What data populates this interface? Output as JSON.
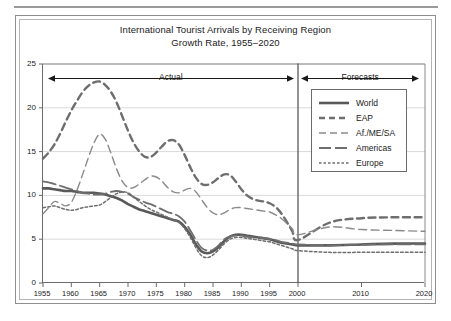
{
  "figure": {
    "title_line1": "International Tourist Arrivals by Receiving Region",
    "title_line2": "Growth Rate, 1955–2020",
    "annotation_actual": "Actual",
    "annotation_forecasts": "Forecasts",
    "divider_year": 2000
  },
  "chart_data": {
    "type": "line",
    "title": "International Tourist Arrivals by Receiving Region Growth Rate, 1955–2020",
    "subtitle": "Growth Rate, 1955–2020",
    "xlabel": "",
    "ylabel": "",
    "xlim": [
      1955,
      2020
    ],
    "ylim": [
      0,
      25
    ],
    "yticks": [
      0,
      5,
      10,
      15,
      20,
      25
    ],
    "xticks": [
      1955,
      1960,
      1965,
      1970,
      1975,
      1980,
      1985,
      1990,
      1995,
      2000,
      2010,
      2020
    ],
    "grid": "horizontal",
    "legend_position": "upper-right-inside",
    "annotations": [
      {
        "label": "Actual",
        "x_from": 1955,
        "x_to": 2000,
        "y": 23.6,
        "style": "double-arrow"
      },
      {
        "label": "Forecasts",
        "x_from": 2000,
        "x_to": 2020,
        "y": 23.6,
        "style": "double-arrow"
      }
    ],
    "vertical_divider_x": 2000,
    "x": [
      1955,
      1956,
      1957,
      1958,
      1959,
      1960,
      1961,
      1962,
      1963,
      1964,
      1965,
      1966,
      1967,
      1968,
      1969,
      1970,
      1971,
      1972,
      1973,
      1974,
      1975,
      1976,
      1977,
      1978,
      1979,
      1980,
      1981,
      1982,
      1983,
      1984,
      1985,
      1986,
      1987,
      1988,
      1989,
      1990,
      1991,
      1992,
      1993,
      1994,
      1995,
      1996,
      1997,
      1998,
      1999,
      2000,
      2005,
      2010,
      2015,
      2020
    ],
    "series": [
      {
        "name": "World",
        "style": "solid",
        "color": "#595959",
        "width": 2.6,
        "values": [
          10.8,
          10.8,
          10.7,
          10.6,
          10.5,
          10.5,
          10.4,
          10.3,
          10.3,
          10.3,
          10.2,
          10.1,
          9.9,
          9.7,
          9.4,
          9.0,
          8.7,
          8.4,
          8.2,
          8.0,
          7.8,
          7.6,
          7.4,
          7.2,
          7.0,
          6.4,
          5.5,
          4.4,
          3.6,
          3.4,
          3.6,
          4.1,
          4.8,
          5.3,
          5.5,
          5.5,
          5.4,
          5.3,
          5.2,
          5.1,
          5.0,
          4.8,
          4.6,
          4.5,
          4.4,
          4.3,
          4.3,
          4.4,
          4.5,
          4.5
        ]
      },
      {
        "name": "EAP",
        "style": "dashed",
        "color": "#6e6e6e",
        "width": 2.4,
        "values": [
          14.2,
          14.9,
          15.8,
          17.0,
          18.4,
          19.7,
          20.8,
          21.8,
          22.5,
          22.9,
          23.0,
          22.6,
          21.8,
          20.6,
          19.0,
          17.4,
          16.0,
          15.0,
          14.4,
          14.4,
          14.9,
          15.6,
          16.2,
          16.3,
          15.8,
          14.6,
          13.2,
          12.0,
          11.3,
          11.2,
          11.5,
          12.0,
          12.4,
          12.3,
          11.6,
          10.7,
          10.0,
          9.6,
          9.4,
          9.3,
          9.1,
          8.7,
          8.0,
          7.0,
          5.9,
          4.9,
          6.9,
          7.4,
          7.5,
          7.5
        ]
      },
      {
        "name": "Af./ME/SA",
        "style": "longdash-thin",
        "color": "#8a8a8a",
        "width": 1.4,
        "values": [
          7.9,
          8.6,
          9.3,
          9.1,
          8.8,
          9.2,
          10.6,
          12.4,
          14.3,
          16.0,
          17.0,
          16.4,
          14.8,
          13.0,
          11.6,
          10.9,
          10.9,
          11.3,
          11.8,
          12.2,
          12.1,
          11.6,
          10.9,
          10.4,
          10.3,
          10.6,
          10.8,
          10.4,
          9.5,
          8.6,
          8.0,
          7.8,
          8.0,
          8.4,
          8.6,
          8.6,
          8.5,
          8.4,
          8.3,
          8.2,
          8.1,
          7.8,
          7.4,
          6.8,
          6.2,
          5.5,
          6.4,
          6.1,
          6.0,
          5.9
        ]
      },
      {
        "name": "Americas",
        "style": "longdash",
        "color": "#6e6e6e",
        "width": 1.8,
        "values": [
          11.6,
          11.5,
          11.3,
          11.1,
          10.9,
          10.7,
          10.5,
          10.3,
          10.2,
          10.1,
          10.1,
          10.2,
          10.4,
          10.5,
          10.4,
          10.2,
          9.8,
          9.5,
          9.2,
          9.0,
          8.7,
          8.4,
          8.1,
          7.9,
          7.6,
          7.0,
          6.0,
          4.9,
          4.0,
          3.7,
          3.8,
          4.3,
          5.0,
          5.3,
          5.4,
          5.4,
          5.3,
          5.2,
          5.2,
          5.1,
          5.0,
          4.9,
          4.7,
          4.6,
          4.5,
          4.4,
          4.3,
          4.4,
          4.4,
          4.4
        ]
      },
      {
        "name": "Europe",
        "style": "dotted",
        "color": "#6e6e6e",
        "width": 1.5,
        "values": [
          8.6,
          8.7,
          8.8,
          8.6,
          8.4,
          8.3,
          8.4,
          8.6,
          8.7,
          8.8,
          8.9,
          9.3,
          9.8,
          10.2,
          10.4,
          10.3,
          9.8,
          9.3,
          8.8,
          8.4,
          8.1,
          7.8,
          7.5,
          7.2,
          6.9,
          6.2,
          5.2,
          4.0,
          3.1,
          2.9,
          3.2,
          3.8,
          4.5,
          5.0,
          5.2,
          5.2,
          5.1,
          5.0,
          4.9,
          4.8,
          4.7,
          4.5,
          4.3,
          4.1,
          3.9,
          3.7,
          3.5,
          3.5,
          3.5,
          3.5
        ]
      }
    ]
  },
  "legend": {
    "items": [
      {
        "label": "World",
        "style": "solid"
      },
      {
        "label": "EAP",
        "style": "dashed"
      },
      {
        "label": "Af./ME/SA",
        "style": "longdash-thin"
      },
      {
        "label": "Americas",
        "style": "longdash"
      },
      {
        "label": "Europe",
        "style": "dotted"
      }
    ]
  },
  "axes": {
    "y_tick_labels": [
      "25",
      "20",
      "15",
      "10",
      "5",
      "0"
    ],
    "x_tick_labels": [
      "1955",
      "1960",
      "1965",
      "1970",
      "1975",
      "1980",
      "1985",
      "1990",
      "1995",
      "2000",
      "2010",
      "2020"
    ]
  }
}
